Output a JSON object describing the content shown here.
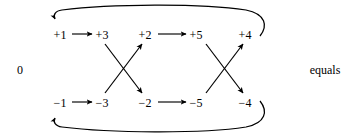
{
  "figure": {
    "background_color": "#ffffff",
    "stroke_color": "#000000",
    "left_label": "0",
    "right_label": "equals"
  },
  "rows": {
    "top": {
      "name": "positive-row",
      "nodes": [
        {
          "label": "+1",
          "x": 60,
          "y": 35
        },
        {
          "label": "+3",
          "x": 102,
          "y": 35
        },
        {
          "label": "+2",
          "x": 145,
          "y": 35
        },
        {
          "label": "+5",
          "x": 196,
          "y": 35
        },
        {
          "label": "+4",
          "x": 245,
          "y": 35
        }
      ]
    },
    "bottom": {
      "name": "negative-row",
      "nodes": [
        {
          "label": "−1",
          "x": 60,
          "y": 103
        },
        {
          "label": "−3",
          "x": 102,
          "y": 103
        },
        {
          "label": "−2",
          "x": 145,
          "y": 103
        },
        {
          "label": "−5",
          "x": 196,
          "y": 103
        },
        {
          "label": "−4",
          "x": 245,
          "y": 103
        }
      ]
    }
  },
  "edges": {
    "horizontal": [
      {
        "name": "arrow-plus1-to-plus3",
        "from": "+1",
        "to": "+3"
      },
      {
        "name": "arrow-plus2-to-plus5",
        "from": "+2",
        "to": "+5"
      },
      {
        "name": "arrow-minus1-to-minus3",
        "from": "−1",
        "to": "−3"
      },
      {
        "name": "arrow-minus2-to-minus5",
        "from": "−2",
        "to": "−5"
      }
    ],
    "crossing": [
      {
        "name": "arrow-plus3-to-minus2",
        "from": "+3",
        "to": "−2"
      },
      {
        "name": "arrow-minus3-to-plus2",
        "from": "−3",
        "to": "+2"
      },
      {
        "name": "arrow-plus5-to-minus4",
        "from": "+5",
        "to": "−4"
      },
      {
        "name": "arrow-minus5-to-plus4",
        "from": "−5",
        "to": "+4"
      }
    ],
    "feedback": [
      {
        "name": "loop-plus4-to-plus1",
        "from": "+4",
        "to": "+1"
      },
      {
        "name": "loop-minus4-to-minus1",
        "from": "−4",
        "to": "−1"
      }
    ]
  }
}
